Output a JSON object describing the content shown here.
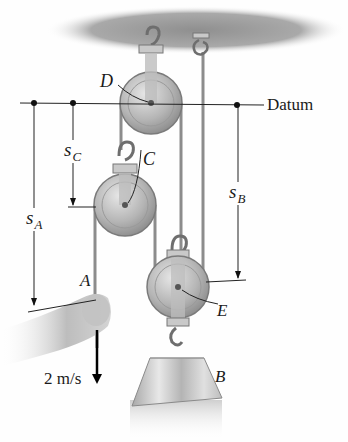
{
  "diagram": {
    "datum_label": "Datum",
    "points": {
      "A": "A",
      "B": "B",
      "C": "C",
      "D": "D",
      "E": "E"
    },
    "coordinates": {
      "sA": {
        "base": "s",
        "sub": "A"
      },
      "sB": {
        "base": "s",
        "sub": "B"
      },
      "sC": {
        "base": "s",
        "sub": "C"
      }
    },
    "velocity_label": "2 m/s",
    "colors": {
      "ceiling": "#9a9a9a",
      "pulley": "#b8b8b8",
      "rope": "#8c8c8c",
      "lines": "#222222",
      "block": "#c4c4c4"
    }
  }
}
